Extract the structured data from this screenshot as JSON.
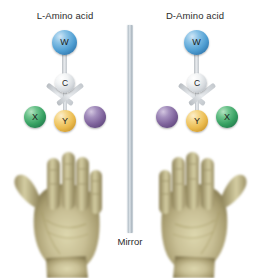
{
  "figure": {
    "background_color": "#ffffff",
    "mirror": {
      "label": "Mirror",
      "bar_color": "#b9c4cc"
    }
  },
  "panels": [
    {
      "id": "left",
      "title": "L-Amino acid",
      "atoms": [
        {
          "name": "atom-w",
          "label": "W",
          "color": "#4f9ed2",
          "position": "top"
        },
        {
          "name": "atom-c",
          "label": "C",
          "color": "#d6dade",
          "position": "center"
        },
        {
          "name": "atom-x",
          "label": "X",
          "color": "#36a061",
          "position": "bottom-left"
        },
        {
          "name": "atom-y",
          "label": "Y",
          "color": "#eaba4d",
          "position": "bottom-center"
        },
        {
          "name": "atom-unlabeled",
          "label": "",
          "color": "#7e629b",
          "position": "bottom-right"
        }
      ],
      "hand": "left-hand",
      "hand_color": "#c9c096"
    },
    {
      "id": "right",
      "title": "D-Amino acid",
      "atoms": [
        {
          "name": "atom-w",
          "label": "W",
          "color": "#4f9ed2",
          "position": "top"
        },
        {
          "name": "atom-c",
          "label": "C",
          "color": "#d6dade",
          "position": "center"
        },
        {
          "name": "atom-unlabeled",
          "label": "",
          "color": "#7e629b",
          "position": "bottom-left"
        },
        {
          "name": "atom-y",
          "label": "Y",
          "color": "#eaba4d",
          "position": "bottom-center"
        },
        {
          "name": "atom-x",
          "label": "X",
          "color": "#36a061",
          "position": "bottom-right"
        }
      ],
      "hand": "right-hand",
      "hand_color": "#c9c096"
    }
  ]
}
